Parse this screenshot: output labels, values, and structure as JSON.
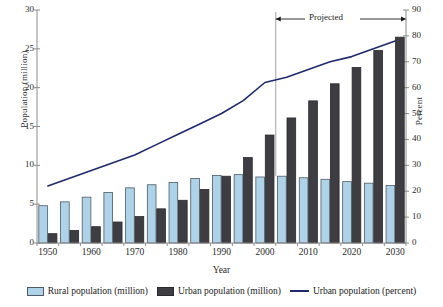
{
  "axes": {
    "y_left_title": "Population (million)",
    "y_right_title": "Percent",
    "x_title": "Year",
    "y_left_ticks": [
      "0",
      "5",
      "10",
      "15",
      "20",
      "25",
      "30"
    ],
    "y_right_ticks": [
      "0",
      "10",
      "20",
      "30",
      "40",
      "50",
      "60",
      "70",
      "80",
      "90"
    ],
    "x_ticks": [
      "1950",
      "1960",
      "1970",
      "1980",
      "1990",
      "2000",
      "2010",
      "2020",
      "2030"
    ]
  },
  "annotation": {
    "projected_label": "Projected"
  },
  "legend": {
    "rural_label": "Rural population (million)",
    "urban_label": "Urban population (million)",
    "percent_label": "Urban population (percent)"
  },
  "colors": {
    "rural_fill": "#aed3e8",
    "rural_stroke": "#4e5a66",
    "urban_fill": "#3d3d42",
    "urban_stroke": "#2a2a2e",
    "line": "#1f2a6e",
    "axis": "#8c8c8c",
    "divider": "#9a9a9a"
  },
  "chart_data": {
    "type": "bar",
    "title": "",
    "xlabel": "Year",
    "ylabel": "Population (million)",
    "y2label": "Percent",
    "ylim": [
      0,
      30
    ],
    "y2lim": [
      0,
      90
    ],
    "grid": false,
    "legend_position": "bottom",
    "projected_from": 2005,
    "categories": [
      "1950",
      "1955",
      "1960",
      "1965",
      "1970",
      "1975",
      "1980",
      "1985",
      "1990",
      "1995",
      "2000",
      "2005",
      "2010",
      "2015",
      "2020",
      "2025",
      "2030"
    ],
    "series": [
      {
        "name": "Rural population (million)",
        "axis": "left",
        "type": "bar",
        "values": [
          4.8,
          5.3,
          5.9,
          6.5,
          7.1,
          7.5,
          7.8,
          8.3,
          8.7,
          8.8,
          8.5,
          8.6,
          8.4,
          8.2,
          7.9,
          7.7,
          7.4
        ]
      },
      {
        "name": "Urban population (million)",
        "axis": "left",
        "type": "bar",
        "values": [
          1.2,
          1.6,
          2.1,
          2.7,
          3.4,
          4.4,
          5.5,
          6.9,
          8.6,
          11.0,
          13.9,
          16.1,
          18.3,
          20.5,
          22.6,
          24.8,
          26.5
        ]
      },
      {
        "name": "Urban population (percent)",
        "axis": "right",
        "type": "line",
        "values": [
          22,
          25,
          28,
          31,
          34,
          38,
          42,
          46,
          50,
          55,
          62,
          64,
          67,
          70,
          72,
          75,
          78
        ]
      }
    ]
  }
}
